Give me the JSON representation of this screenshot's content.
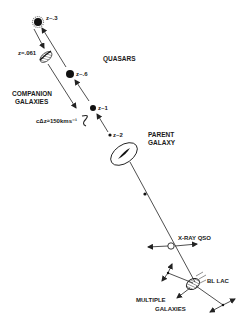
{
  "diagram": {
    "labels": {
      "z_03": "z~.3",
      "z_061": "z=.061",
      "z_06": "z~.6",
      "z_1": "z~1",
      "z_2": "z~2",
      "quasars": "QUASARS",
      "companion_line1": "COMPANION",
      "companion_line2": "GALAXIES",
      "velocity": "cΔz≈150kms⁻¹",
      "parent_line1": "PARENT",
      "parent_line2": "GALAXY",
      "xray_qso": "X-RAY QSO",
      "bl_lac": "BL LAC",
      "multiple_line1": "MULTIPLE",
      "multiple_line2": "GALAXIES"
    },
    "colors": {
      "ink": "#1a1a1a",
      "background": "#ffffff"
    }
  }
}
